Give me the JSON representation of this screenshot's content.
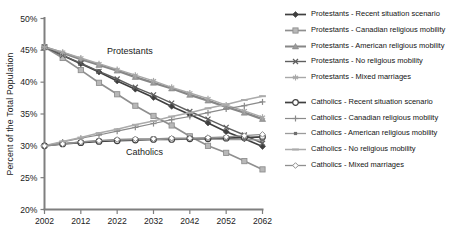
{
  "chart_data": {
    "type": "line",
    "title": "",
    "xlabel": "",
    "ylabel": "Percent of the Total Population",
    "ylim": [
      20,
      50
    ],
    "y_ticks": [
      {
        "value": 20,
        "label": "20%"
      },
      {
        "value": 25,
        "label": "25%"
      },
      {
        "value": 30,
        "label": "30%"
      },
      {
        "value": 35,
        "label": "35%"
      },
      {
        "value": 40,
        "label": "40%"
      },
      {
        "value": 45,
        "label": "45%"
      },
      {
        "value": 50,
        "label": "50%"
      }
    ],
    "x_ticks": [
      2002,
      2012,
      2022,
      2032,
      2042,
      2052,
      2062
    ],
    "x": [
      2002,
      2007,
      2012,
      2017,
      2022,
      2027,
      2032,
      2037,
      2042,
      2047,
      2052,
      2057,
      2062
    ],
    "grid": false,
    "legend_position": "right",
    "annotations": [
      {
        "text": "Protestants",
        "year": 2025.5,
        "pct": 44.4
      },
      {
        "text": "Catholics",
        "year": 2029.5,
        "pct": 28.5
      }
    ],
    "series": [
      {
        "label": "Protestants - Recent situation scenario",
        "marker": "filled-diamond",
        "color": "#3f3f3f",
        "fill": "#3f3f3f",
        "width": 1.7,
        "values": [
          45.5,
          44.2,
          42.9,
          41.6,
          40.2,
          38.9,
          37.6,
          36.2,
          34.9,
          33.6,
          32.2,
          31.1,
          29.9
        ]
      },
      {
        "label": "Protestants - Canadian religious mobility",
        "marker": "filled-square",
        "color": "#8f8f8f",
        "fill": "#b8b8b8",
        "width": 1.7,
        "values": [
          45.5,
          43.8,
          41.9,
          39.9,
          38.1,
          36.3,
          34.7,
          33.2,
          31.5,
          30.0,
          28.9,
          27.6,
          26.3
        ]
      },
      {
        "label": "Protestants - American religious mobility",
        "marker": "filled-triangle",
        "color": "#878787",
        "fill": "#9a9a9a",
        "width": 2.3,
        "values": [
          45.5,
          44.6,
          43.6,
          42.7,
          41.8,
          40.8,
          39.9,
          39.0,
          38.0,
          37.1,
          36.1,
          35.2,
          34.2
        ]
      },
      {
        "label": "Protestants - No religious mobility",
        "marker": "x",
        "color": "#5f5f5f",
        "fill": "#5f5f5f",
        "width": 1.4,
        "values": [
          45.5,
          44.2,
          43.0,
          41.7,
          40.5,
          39.2,
          38.0,
          36.7,
          35.4,
          34.2,
          32.9,
          31.7,
          30.4
        ]
      },
      {
        "label": "Protestants - Mixed marriages",
        "marker": "asterisk",
        "color": "#a8a8a8",
        "fill": "#a8a8a8",
        "width": 1.4,
        "values": [
          45.5,
          44.7,
          43.8,
          42.9,
          42.0,
          41.1,
          40.2,
          39.2,
          38.3,
          37.4,
          36.4,
          35.5,
          34.5
        ]
      },
      {
        "label": "Catholics - Recent situation scenario",
        "marker": "open-circle",
        "color": "#3f3f3f",
        "fill": "#ffffff",
        "width": 1.7,
        "values": [
          30.0,
          30.3,
          30.5,
          30.7,
          30.8,
          30.9,
          31.0,
          31.0,
          31.1,
          31.1,
          31.2,
          31.3,
          31.4
        ]
      },
      {
        "label": "Catholics - Canadian religious mobility",
        "marker": "plus",
        "color": "#8a8a8a",
        "fill": "#8a8a8a",
        "width": 1.2,
        "values": [
          30.0,
          30.6,
          31.2,
          31.7,
          32.3,
          32.9,
          33.5,
          34.1,
          34.6,
          35.2,
          35.8,
          36.3,
          36.9
        ]
      },
      {
        "label": "Catholics - American religious mobility",
        "marker": "dot",
        "color": "#9b9b9b",
        "fill": "#6f6f6f",
        "width": 1.3,
        "values": [
          30.0,
          30.3,
          30.6,
          30.8,
          30.9,
          31.0,
          31.0,
          31.1,
          31.1,
          31.1,
          31.0,
          31.0,
          30.9
        ]
      },
      {
        "label": "Catholics - No religious mobility",
        "marker": "dash",
        "color": "#ababab",
        "fill": "#ababab",
        "width": 1.5,
        "values": [
          30.0,
          30.7,
          31.3,
          32.0,
          32.6,
          33.3,
          33.9,
          34.6,
          35.2,
          35.9,
          36.5,
          37.2,
          37.8
        ]
      },
      {
        "label": "Catholics - Mixed marriages",
        "marker": "open-diamond",
        "color": "#8f8f8f",
        "fill": "#ffffff",
        "width": 1.3,
        "values": [
          30.0,
          30.3,
          30.6,
          30.8,
          31.0,
          31.1,
          31.1,
          31.2,
          31.2,
          31.3,
          31.4,
          31.6,
          31.8
        ]
      }
    ]
  },
  "axis_color": "#7f7f7f",
  "text_color": "#1c1c1c"
}
